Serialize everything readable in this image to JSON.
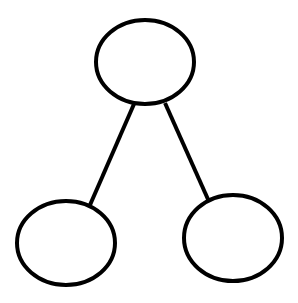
{
  "diagram": {
    "type": "tree",
    "background": "#ffffff",
    "stroke_color": "#000000",
    "stroke_width": 4,
    "nodes": [
      {
        "id": "root",
        "label": "",
        "cx": 145,
        "cy": 62,
        "rx": 49,
        "ry": 42
      },
      {
        "id": "left-child",
        "label": "",
        "cx": 66,
        "cy": 243,
        "rx": 49,
        "ry": 42
      },
      {
        "id": "right-child",
        "label": "",
        "cx": 233,
        "cy": 238,
        "rx": 49,
        "ry": 43
      }
    ],
    "edges": [
      {
        "from": "root",
        "to": "left-child",
        "x1": 134,
        "y1": 104,
        "x2": 90,
        "y2": 205
      },
      {
        "from": "root",
        "to": "right-child",
        "x1": 165,
        "y1": 103,
        "x2": 211,
        "y2": 206
      }
    ]
  }
}
